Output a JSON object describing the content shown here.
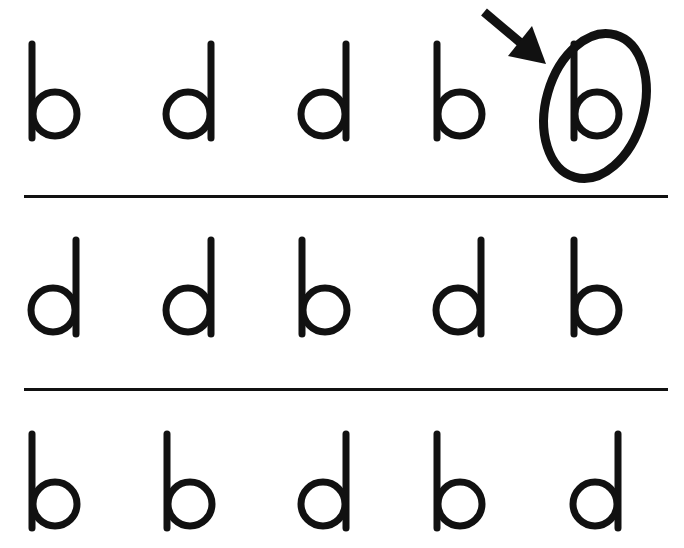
{
  "worksheet": {
    "ink_color": "#111111",
    "background": "#ffffff",
    "rows": [
      {
        "letters": [
          "b",
          "d",
          "d",
          "b",
          "b"
        ],
        "circled_index": 4
      },
      {
        "letters": [
          "d",
          "d",
          "b",
          "d",
          "b"
        ],
        "circled_index": null
      },
      {
        "letters": [
          "b",
          "b",
          "d",
          "b",
          "d"
        ],
        "circled_index": null
      }
    ],
    "example_marker": {
      "icon": "arrow-icon",
      "shape": "ellipse-circle",
      "points_to_row": 0,
      "points_to_index": 4
    },
    "dividers": 2
  }
}
